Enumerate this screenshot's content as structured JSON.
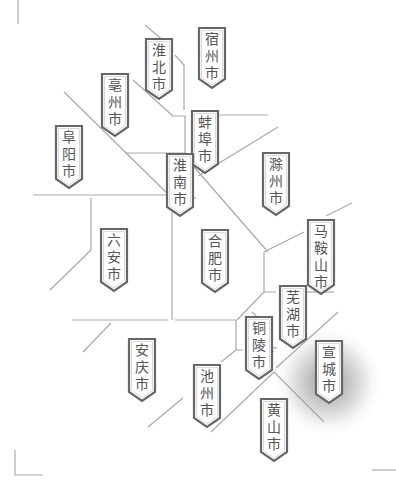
{
  "map": {
    "region": "Anhui Province",
    "line_color": "#a9a9a9",
    "label_border_color": "#666666",
    "label_text_color": "#555555",
    "highlight": "宣城市",
    "cities": [
      {
        "id": "suzhou",
        "name": "宿州市",
        "chars": [
          "宿",
          "州",
          "市"
        ],
        "x": 198,
        "y": 27,
        "h": 52
      },
      {
        "id": "huaibei",
        "name": "淮北市",
        "chars": [
          "淮",
          "北",
          "市"
        ],
        "x": 145,
        "y": 38,
        "h": 52
      },
      {
        "id": "bozhou",
        "name": "亳州市",
        "chars": [
          "亳",
          "州",
          "市"
        ],
        "x": 101,
        "y": 73,
        "h": 54
      },
      {
        "id": "fuyang",
        "name": "阜阳市",
        "chars": [
          "阜",
          "阳",
          "市"
        ],
        "x": 55,
        "y": 125,
        "h": 54
      },
      {
        "id": "bengbu",
        "name": "蚌埠市",
        "chars": [
          "蚌",
          "埠",
          "市"
        ],
        "x": 191,
        "y": 110,
        "h": 54
      },
      {
        "id": "huainan",
        "name": "淮南市",
        "chars": [
          "淮",
          "南",
          "市"
        ],
        "x": 166,
        "y": 153,
        "h": 54
      },
      {
        "id": "chuzhou",
        "name": "滁州市",
        "chars": [
          "滁",
          "州",
          "市"
        ],
        "x": 262,
        "y": 152,
        "h": 54
      },
      {
        "id": "luan",
        "name": "六安市",
        "chars": [
          "六",
          "安",
          "市"
        ],
        "x": 100,
        "y": 228,
        "h": 54
      },
      {
        "id": "hefei",
        "name": "合肥市",
        "chars": [
          "合",
          "肥",
          "市"
        ],
        "x": 201,
        "y": 229,
        "h": 54
      },
      {
        "id": "maanshan",
        "name": "马鞍山市",
        "chars": [
          "马",
          "鞍",
          "山",
          "市"
        ],
        "x": 307,
        "y": 219,
        "h": 66
      },
      {
        "id": "wuhu",
        "name": "芜湖市",
        "chars": [
          "芜",
          "湖",
          "市"
        ],
        "x": 279,
        "y": 285,
        "h": 54
      },
      {
        "id": "tongling",
        "name": "铜陵市",
        "chars": [
          "铜",
          "陵",
          "市"
        ],
        "x": 245,
        "y": 316,
        "h": 54
      },
      {
        "id": "anqing",
        "name": "安庆市",
        "chars": [
          "安",
          "庆",
          "市"
        ],
        "x": 128,
        "y": 338,
        "h": 54
      },
      {
        "id": "chizhou",
        "name": "池州市",
        "chars": [
          "池",
          "州",
          "市"
        ],
        "x": 193,
        "y": 364,
        "h": 54
      },
      {
        "id": "xuancheng",
        "name": "宣城市",
        "chars": [
          "宣",
          "城",
          "市"
        ],
        "x": 315,
        "y": 340,
        "h": 54
      },
      {
        "id": "huangshan",
        "name": "黄山市",
        "chars": [
          "黄",
          "山",
          "市"
        ],
        "x": 260,
        "y": 398,
        "h": 54
      }
    ]
  }
}
